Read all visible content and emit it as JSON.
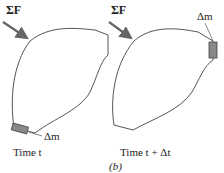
{
  "figure": {
    "label": "(b)",
    "panels": [
      {
        "name": "time-t",
        "force_label": "ΣF",
        "mass_label": "Δm",
        "caption": "Time t"
      },
      {
        "name": "time-t-plus-dt",
        "force_label": "ΣF",
        "mass_label": "Δm",
        "caption": "Time t + Δt"
      }
    ],
    "colors": {
      "outline": "#555555",
      "arrow": "#666666",
      "mass_element": "#888888"
    }
  }
}
